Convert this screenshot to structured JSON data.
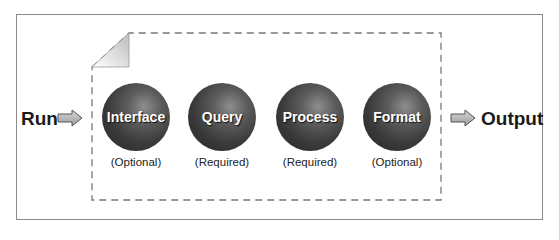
{
  "diagram": {
    "input_label": "Run",
    "output_label": "Output",
    "stages": [
      {
        "name": "Interface",
        "requirement": "(Optional)"
      },
      {
        "name": "Query",
        "requirement": "(Required)"
      },
      {
        "name": "Process",
        "requirement": "(Required)"
      },
      {
        "name": "Format",
        "requirement": "(Optional)"
      }
    ],
    "icons": {
      "input_arrow": "right-arrow-icon",
      "output_arrow": "right-arrow-icon",
      "container": "dog-eared-page-icon"
    },
    "colors": {
      "ball": "#3a3a3a",
      "ball_text": "#ffffff",
      "frame": "#8a8a8a",
      "dashed_border": "#777777",
      "arrow_fill": "#b9b9b9"
    }
  }
}
